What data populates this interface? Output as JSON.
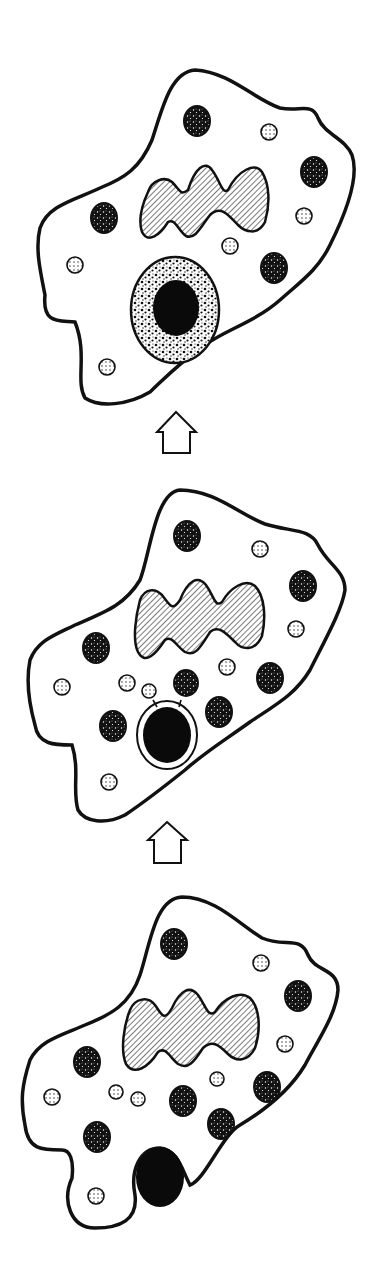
{
  "diagram": {
    "type": "process-sequence",
    "direction": "bottom-to-top",
    "colors": {
      "ink": "#111111",
      "background": "#ffffff",
      "particle": "#0a0a0a"
    },
    "stages": [
      {
        "id": "stage-1-engulfing",
        "position": "bottom",
        "description": "Cell membrane wraps around black particle at cell edge"
      },
      {
        "id": "stage-2-phagosome",
        "position": "middle",
        "description": "Particle enclosed in vacuole; lysosomes fusing with it"
      },
      {
        "id": "stage-3-digestion",
        "position": "top",
        "description": "Phagolysosome with stippled digestive contents around particle"
      }
    ],
    "arrows": [
      {
        "id": "arrow-stage1-to-stage2",
        "glyph": "up-arrow-outline"
      },
      {
        "id": "arrow-stage2-to-stage3",
        "glyph": "up-arrow-outline"
      }
    ],
    "legend_of_shapes": {
      "nucleus": "hatched lobed shape",
      "dark_granules": "dark stippled ovals",
      "light_granules": "small dotted circles",
      "particle": "solid black oval"
    }
  }
}
